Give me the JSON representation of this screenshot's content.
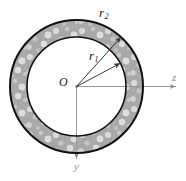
{
  "figure": {
    "type": "technical-diagram",
    "canvas": {
      "width": 186,
      "height": 181,
      "background": "#ffffff"
    },
    "geometry": {
      "center": {
        "x": 76.5,
        "y": 86.5
      },
      "outer_radius": 66.5,
      "inner_radius": 49.5,
      "outer_stroke": "#111111",
      "inner_stroke": "#111111",
      "annulus_fill": "#a8a8a8",
      "annulus_texture": "speckled-concrete",
      "core_fill": "#ffffff"
    },
    "axes": {
      "color": "#9a9a9a",
      "z": {
        "label": "z",
        "direction": "right",
        "from": {
          "x": 76.5,
          "y": 86.5
        },
        "to": {
          "x": 178,
          "y": 86.5
        }
      },
      "y": {
        "label": "y",
        "direction": "down",
        "from": {
          "x": 76.5,
          "y": 86.5
        },
        "to": {
          "x": 76.5,
          "y": 161
        }
      }
    },
    "origin": {
      "label": "O"
    },
    "dimensions": [
      {
        "name": "inner-radius-arrow",
        "symbol": "r",
        "subscript": "1",
        "angle_deg": 28,
        "length": 49.5,
        "color": "#4a4a4a"
      },
      {
        "name": "outer-radius-arrow",
        "symbol": "r",
        "subscript": "2",
        "angle_deg": 48,
        "length": 66.5,
        "color": "#4a4a4a"
      }
    ]
  }
}
